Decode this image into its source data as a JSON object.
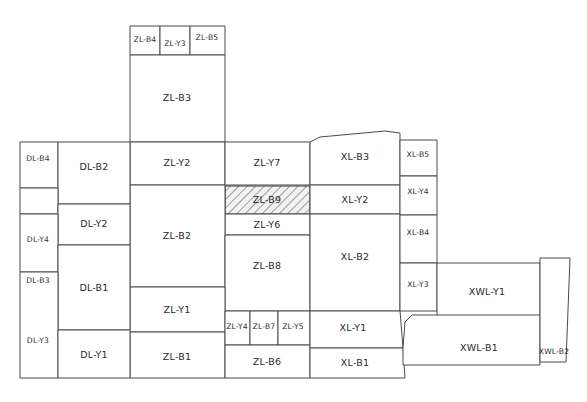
{
  "diagram": {
    "type": "zone-block-layout",
    "canvas": {
      "width": 587,
      "height": 402
    },
    "style": {
      "background_color": "#ffffff",
      "line_color": "#4a4a4a",
      "text_color": "#2b2b2b",
      "hatch_color": "#555555",
      "hatch_fill": "#f2f2f2"
    },
    "groups": [
      {
        "id": "DL",
        "prefix": "DL",
        "name": "DL zone group"
      },
      {
        "id": "ZL",
        "prefix": "ZL",
        "name": "ZL zone group"
      },
      {
        "id": "XL",
        "prefix": "XL",
        "name": "XL zone group"
      },
      {
        "id": "XWL",
        "prefix": "XWL",
        "name": "XWL zone group"
      }
    ],
    "cells": [
      {
        "id": "zl-b4",
        "label": "ZL-B4",
        "group": "ZL",
        "points": "130,26 160,26 160,55 130,55",
        "label_x": 145,
        "label_y": 40,
        "size": "tiny",
        "hatched": false
      },
      {
        "id": "zl-y3",
        "label": "ZL-Y3",
        "group": "ZL",
        "points": "160,26 190,26 190,55 160,55",
        "label_x": 175,
        "label_y": 44,
        "size": "tiny",
        "hatched": false
      },
      {
        "id": "zl-b5",
        "label": "ZL-B5",
        "group": "ZL",
        "points": "190,26 225,26 225,55 190,55",
        "label_x": 207,
        "label_y": 38,
        "size": "tiny",
        "hatched": false
      },
      {
        "id": "zl-b3",
        "label": "ZL-B3",
        "group": "ZL",
        "points": "130,55 225,55 225,142 130,142",
        "label_x": 177,
        "label_y": 98,
        "size": "normal",
        "hatched": false
      },
      {
        "id": "zl-y2",
        "label": "ZL-Y2",
        "group": "ZL",
        "points": "130,142 225,142 225,185 130,185",
        "label_x": 177,
        "label_y": 163,
        "size": "normal",
        "hatched": false
      },
      {
        "id": "zl-y7",
        "label": "ZL-Y7",
        "group": "ZL",
        "points": "225,142 310,142 310,185 225,185",
        "label_x": 267,
        "label_y": 163,
        "size": "normal",
        "hatched": false
      },
      {
        "id": "zl-b9",
        "label": "ZL-B9",
        "group": "ZL",
        "points": "225,186 310,186 310,214 225,214",
        "label_x": 267,
        "label_y": 200,
        "size": "normal",
        "hatched": true
      },
      {
        "id": "zl-y6",
        "label": "ZL-Y6",
        "group": "ZL",
        "points": "225,214 310,214 310,235 225,235",
        "label_x": 267,
        "label_y": 225,
        "size": "normal",
        "hatched": false
      },
      {
        "id": "zl-b2",
        "label": "ZL-B2",
        "group": "ZL",
        "points": "130,185 225,185 225,287 130,287",
        "label_x": 177,
        "label_y": 236,
        "size": "normal",
        "hatched": false
      },
      {
        "id": "zl-b8",
        "label": "ZL-B8",
        "group": "ZL",
        "points": "225,235 310,235 310,311 225,311",
        "label_x": 267,
        "label_y": 266,
        "size": "normal",
        "hatched": false
      },
      {
        "id": "zl-y1",
        "label": "ZL-Y1",
        "group": "ZL",
        "points": "130,287 225,287 225,332 130,332",
        "label_x": 177,
        "label_y": 310,
        "size": "normal",
        "hatched": false
      },
      {
        "id": "zl-b1",
        "label": "ZL-B1",
        "group": "ZL",
        "points": "130,332 225,332 225,378 130,378",
        "label_x": 177,
        "label_y": 357,
        "size": "normal",
        "hatched": false
      },
      {
        "id": "zl-y4",
        "label": "ZL-Y4",
        "group": "ZL",
        "points": "225,311 250,311 250,345 225,345",
        "label_x": 237,
        "label_y": 327,
        "size": "tiny",
        "hatched": false
      },
      {
        "id": "zl-b7",
        "label": "ZL-B7",
        "group": "ZL",
        "points": "250,311 278,311 278,345 250,345",
        "label_x": 264,
        "label_y": 327,
        "size": "tiny",
        "hatched": false
      },
      {
        "id": "zl-y5",
        "label": "ZL-Y5",
        "group": "ZL",
        "points": "278,311 310,311 310,345 278,345",
        "label_x": 293,
        "label_y": 327,
        "size": "tiny",
        "hatched": false
      },
      {
        "id": "zl-b6",
        "label": "ZL-B6",
        "group": "ZL",
        "points": "225,345 310,345 310,378 225,378",
        "label_x": 267,
        "label_y": 362,
        "size": "normal",
        "hatched": false
      },
      {
        "id": "dl-b4",
        "label": "DL-B4",
        "group": "DL",
        "points": "20,142 58,142 58,188 20,188",
        "label_x": 38,
        "label_y": 159,
        "size": "tiny",
        "hatched": false
      },
      {
        "id": "dl-b2",
        "label": "DL-B2",
        "group": "DL",
        "points": "58,142 130,142 130,204 58,204",
        "label_x": 94,
        "label_y": 167,
        "size": "normal",
        "hatched": false
      },
      {
        "id": "dl-y4",
        "label": "DL-Y4",
        "group": "DL",
        "points": "20,188 58,188 58,214 20,214",
        "label_x": 38,
        "label_y": 240,
        "size": "tiny",
        "hatched": false
      },
      {
        "id": "dl-y2",
        "label": "DL-Y2",
        "group": "DL",
        "points": "58,204 130,204 130,245 58,245",
        "label_x": 94,
        "label_y": 224,
        "size": "normal",
        "hatched": false
      },
      {
        "id": "dl-b3",
        "label": "DL-B3",
        "group": "DL",
        "points": "20,214 58,214 58,272 20,272",
        "label_x": 38,
        "label_y": 281,
        "size": "tiny",
        "hatched": false
      },
      {
        "id": "dl-b1",
        "label": "DL-B1",
        "group": "DL",
        "points": "58,245 130,245 130,330 58,330",
        "label_x": 94,
        "label_y": 288,
        "size": "normal",
        "hatched": false
      },
      {
        "id": "dl-y3",
        "label": "DL-Y3",
        "group": "DL",
        "points": "20,272 58,272 58,378 20,378",
        "label_x": 38,
        "label_y": 341,
        "size": "tiny",
        "hatched": false
      },
      {
        "id": "dl-y1",
        "label": "DL-Y1",
        "group": "DL",
        "points": "58,330 130,330 130,378 58,378",
        "label_x": 94,
        "label_y": 355,
        "size": "normal",
        "hatched": false
      },
      {
        "id": "xl-b3",
        "label": "XL-B3",
        "group": "XL",
        "points": "310,142 320,137 385,131 400,133 400,185 310,185",
        "label_x": 355,
        "label_y": 157,
        "size": "normal",
        "hatched": false
      },
      {
        "id": "xl-y2",
        "label": "XL-Y2",
        "group": "XL",
        "points": "310,185 400,185 400,214 310,214",
        "label_x": 355,
        "label_y": 200,
        "size": "normal",
        "hatched": false
      },
      {
        "id": "xl-b2",
        "label": "XL-B2",
        "group": "XL",
        "points": "310,214 400,214 400,311 310,311",
        "label_x": 355,
        "label_y": 257,
        "size": "normal",
        "hatched": false
      },
      {
        "id": "xl-b5",
        "label": "XL-B5",
        "group": "XL",
        "points": "400,140 437,140 437,176 400,176",
        "label_x": 418,
        "label_y": 155,
        "size": "tiny",
        "hatched": false
      },
      {
        "id": "xl-y4",
        "label": "XL-Y4",
        "group": "XL",
        "points": "400,176 437,176 437,215 400,215",
        "label_x": 418,
        "label_y": 192,
        "size": "tiny",
        "hatched": false
      },
      {
        "id": "xl-b4",
        "label": "XL-B4",
        "group": "XL",
        "points": "400,215 437,215 437,263 400,263",
        "label_x": 418,
        "label_y": 233,
        "size": "tiny",
        "hatched": false
      },
      {
        "id": "xl-y3",
        "label": "XL-Y3",
        "group": "XL",
        "points": "400,263 437,263 437,311 400,311",
        "label_x": 418,
        "label_y": 285,
        "size": "tiny",
        "hatched": false
      },
      {
        "id": "xl-y1",
        "label": "XL-Y1",
        "group": "XL",
        "points": "310,311 400,311 403,348 310,348",
        "label_x": 353,
        "label_y": 328,
        "size": "normal",
        "hatched": false
      },
      {
        "id": "xl-b1",
        "label": "XL-B1",
        "group": "XL",
        "points": "310,348 403,348 405,378 310,378",
        "label_x": 355,
        "label_y": 363,
        "size": "normal",
        "hatched": false
      },
      {
        "id": "xwl-y1",
        "label": "XWL-Y1",
        "group": "XWL",
        "points": "437,263 540,263 540,320 437,320",
        "label_x": 487,
        "label_y": 292,
        "size": "normal",
        "hatched": false
      },
      {
        "id": "xwl-b1",
        "label": "XWL-B1",
        "group": "XWL",
        "points": "403,348 405,322 412,315 540,315 540,365 403,365",
        "label_x": 479,
        "label_y": 348,
        "size": "normal",
        "hatched": false
      },
      {
        "id": "xwl-b2",
        "label": "XWL-B2",
        "group": "XWL",
        "points": "540,258 570,258 566,362 540,362",
        "label_x": 554,
        "label_y": 352,
        "size": "tiny",
        "hatched": false
      }
    ]
  }
}
